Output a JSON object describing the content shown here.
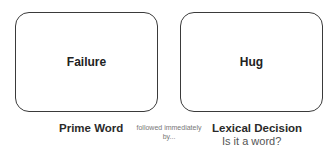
{
  "prime": {
    "word": "Failure",
    "label": "Prime Word"
  },
  "connector": {
    "line1": "followed immediately",
    "line2": "by..."
  },
  "target": {
    "word": "Hug",
    "label": "Lexical Decision",
    "question": "Is it a word?"
  }
}
